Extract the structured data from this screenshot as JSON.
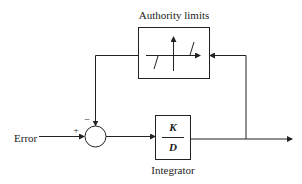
{
  "diagram": {
    "type": "block-diagram",
    "blocks": {
      "authority_limits": {
        "label": "Authority limits",
        "content": "dead-zone / saturation nonlinearity characteristic"
      },
      "integrator": {
        "label": "Integrator",
        "numerator": "K",
        "denominator": "D"
      },
      "summing_junction": {
        "plus_sign": "+",
        "minus_sign": "−"
      }
    },
    "signals": {
      "input_label": "Error"
    },
    "connections": [
      {
        "from": "Error",
        "to": "summing_junction",
        "sign": "+"
      },
      {
        "from": "summing_junction",
        "to": "integrator"
      },
      {
        "from": "integrator",
        "to": "output"
      },
      {
        "from": "output",
        "to": "authority_limits"
      },
      {
        "from": "authority_limits",
        "to": "summing_junction",
        "sign": "-"
      }
    ]
  }
}
